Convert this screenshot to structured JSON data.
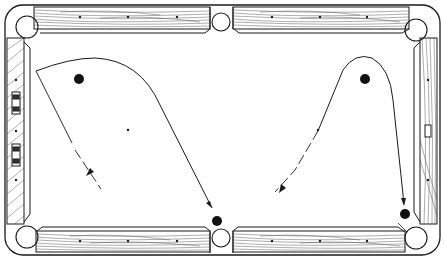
{
  "figure": {
    "style": "black-and-white line illustration",
    "colors": {
      "ink": "#1a1a1a",
      "cloth": "#ffffff",
      "ball": "#111111"
    }
  },
  "table": {
    "pockets": [
      "top-left corner",
      "top side",
      "top-right corner",
      "bottom-left corner",
      "bottom side",
      "bottom-right corner"
    ],
    "rails": [
      "top-left",
      "top-right",
      "left",
      "right",
      "bottom-left",
      "bottom-right"
    ],
    "diamonds_per_long_rail_half": 3,
    "diamonds_per_short_rail": 3,
    "spots": [
      "head-spot",
      "foot-spot"
    ]
  },
  "shots": [
    {
      "name": "left-shot",
      "object_ball": "near top-left corner",
      "target_pocket": "bottom side",
      "path": "curved cue path arcing over the object ball down to the bottom side pocket",
      "approach": "dashed line with arrow from lower-left"
    },
    {
      "name": "right-shot",
      "object_ball": "near top-right corner",
      "target_pocket": "bottom-right corner",
      "path": "curved cue path arcing over the object ball down to the bottom-right corner pocket",
      "approach": "dashed line with arrow from lower-left"
    }
  ],
  "caption": "Billiard table diagram with two curved shot paths"
}
